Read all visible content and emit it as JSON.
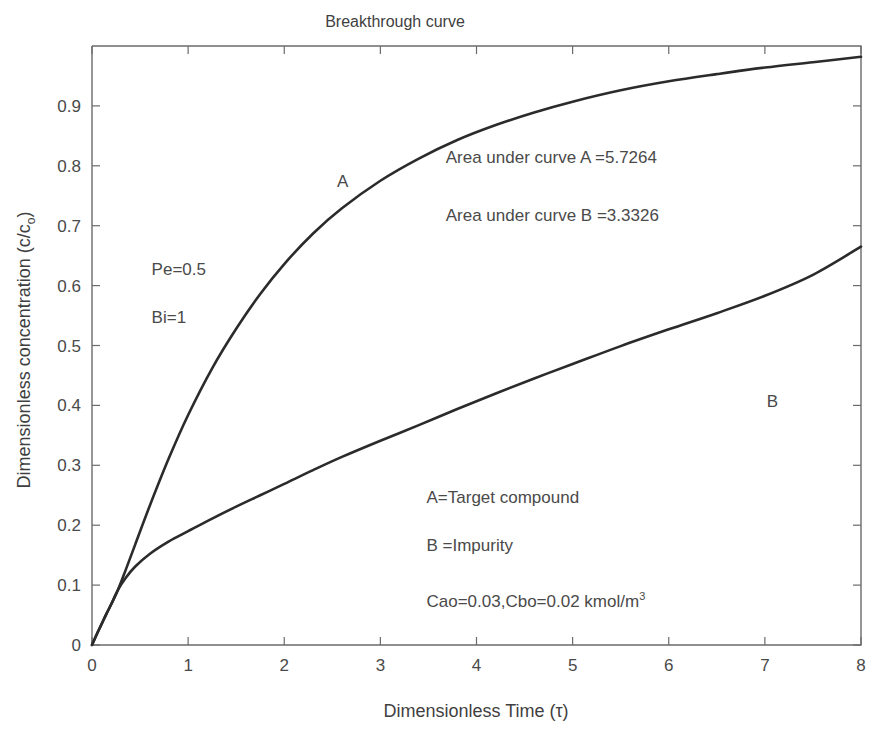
{
  "chart_data": {
    "type": "line",
    "title": "Breakthrough curve",
    "xlabel": "Dimensionless Time (τ)",
    "ylabel_prefix": "Dimensionless concentration (c/c",
    "ylabel_sub": "o",
    "ylabel_suffix": ")",
    "xlim": [
      0,
      8
    ],
    "ylim": [
      0,
      1
    ],
    "xticks": [
      "0",
      "1",
      "2",
      "3",
      "4",
      "5",
      "6",
      "7",
      "8"
    ],
    "xtick_values": [
      0,
      1,
      2,
      3,
      4,
      5,
      6,
      7,
      8
    ],
    "yticks": [
      "0",
      "0.1",
      "0.2",
      "0.3",
      "0.4",
      "0.5",
      "0.6",
      "0.7",
      "0.8",
      "0.9"
    ],
    "ytick_values": [
      0,
      0.1,
      0.2,
      0.3,
      0.4,
      0.5,
      0.6,
      0.7,
      0.8,
      0.9
    ],
    "grid": false,
    "legend_position": "inline-annotations",
    "line_color": "#2b2b2b",
    "axis_color": "#6b6b6b",
    "series": [
      {
        "name": "A",
        "description": "Target compound breakthrough curve",
        "x": [
          0,
          0.05,
          0.1,
          0.15,
          0.2,
          0.27,
          0.35,
          0.45,
          0.6,
          0.8,
          1.0,
          1.25,
          1.5,
          1.75,
          2.0,
          2.3,
          2.6,
          3.0,
          3.4,
          3.8,
          4.2,
          4.6,
          5.0,
          5.5,
          6.0,
          6.5,
          7.0,
          7.5,
          8.0
        ],
        "y": [
          0,
          0.018,
          0.035,
          0.052,
          0.068,
          0.092,
          0.125,
          0.168,
          0.232,
          0.312,
          0.384,
          0.462,
          0.528,
          0.586,
          0.636,
          0.687,
          0.729,
          0.775,
          0.812,
          0.843,
          0.868,
          0.889,
          0.907,
          0.926,
          0.941,
          0.953,
          0.964,
          0.973,
          0.982
        ]
      },
      {
        "name": "B",
        "description": "Impurity breakthrough curve",
        "x": [
          0,
          0.05,
          0.1,
          0.15,
          0.2,
          0.27,
          0.35,
          0.45,
          0.6,
          0.8,
          1.0,
          1.25,
          1.5,
          1.75,
          2.0,
          2.3,
          2.6,
          3.0,
          3.4,
          3.8,
          4.2,
          4.6,
          5.0,
          5.5,
          6.0,
          6.5,
          7.0,
          7.5,
          8.0
        ],
        "y": [
          0,
          0.018,
          0.035,
          0.052,
          0.068,
          0.092,
          0.112,
          0.131,
          0.152,
          0.173,
          0.19,
          0.211,
          0.231,
          0.25,
          0.269,
          0.292,
          0.314,
          0.341,
          0.367,
          0.394,
          0.42,
          0.445,
          0.469,
          0.499,
          0.527,
          0.554,
          0.583,
          0.618,
          0.665
        ]
      }
    ],
    "annotations": [
      {
        "id": "curve-label-a",
        "text": "A",
        "x": 2.55,
        "y": 0.765
      },
      {
        "id": "curve-label-b",
        "text": "B",
        "x": 7.02,
        "y": 0.397
      },
      {
        "id": "area-a",
        "text": "Area under curve A =5.7264",
        "x": 3.68,
        "y": 0.805
      },
      {
        "id": "area-b",
        "text": "Area under curve B =3.3326",
        "x": 3.68,
        "y": 0.708
      },
      {
        "id": "pe",
        "text": "Pe=0.5",
        "x": 0.62,
        "y": 0.617
      },
      {
        "id": "bi",
        "text": "Bi=1",
        "x": 0.62,
        "y": 0.538
      },
      {
        "id": "legend-a",
        "text": "A=Target compound",
        "x": 3.48,
        "y": 0.237
      },
      {
        "id": "legend-b",
        "text": "B =Impurity",
        "x": 3.48,
        "y": 0.157
      }
    ],
    "concentration_note": {
      "prefix": "Cao=0.03,Cbo=0.02 kmol/m",
      "superscript": "3",
      "x": 3.48,
      "y": 0.063
    },
    "areas": {
      "curve_a": 5.7264,
      "curve_b": 3.3326
    },
    "parameters": {
      "Pe": 0.5,
      "Bi": 1,
      "Cao": 0.03,
      "Cbo": 0.02,
      "concentration_units": "kmol/m3"
    }
  }
}
